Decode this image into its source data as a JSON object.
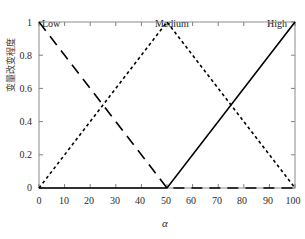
{
  "chart_data": {
    "type": "line",
    "title": "",
    "xlabel": "α",
    "ylabel": "变量改变程度",
    "xlim": [
      0,
      100
    ],
    "ylim": [
      0,
      1
    ],
    "grid": false,
    "legend_position": "none",
    "xticks": [
      "0",
      "10",
      "20",
      "30",
      "40",
      "50",
      "60",
      "70",
      "80",
      "90",
      "100"
    ],
    "xtick_values": [
      0,
      10,
      20,
      30,
      40,
      50,
      60,
      70,
      80,
      90,
      100
    ],
    "yticks": [
      "0",
      "0.2",
      "0.4",
      "0.6",
      "0.8",
      "1"
    ],
    "ytick_values": [
      0,
      0.2,
      0.4,
      0.6,
      0.8,
      1
    ],
    "series": [
      {
        "name": "Low",
        "style": "dashed",
        "color": "#000000",
        "x": [
          0,
          50,
          100
        ],
        "y": [
          1,
          0,
          0
        ]
      },
      {
        "name": "Medium",
        "style": "dotted",
        "color": "#000000",
        "x": [
          0,
          50,
          100
        ],
        "y": [
          0,
          1,
          0
        ]
      },
      {
        "name": "High",
        "style": "solid",
        "color": "#000000",
        "x": [
          0,
          50,
          100
        ],
        "y": [
          0,
          0,
          1
        ]
      }
    ],
    "annotations": [
      {
        "text": "Low",
        "x": 2,
        "y": 1.0
      },
      {
        "text": "Medium",
        "x": 43,
        "y": 1.0
      },
      {
        "text": "High",
        "x": 90,
        "y": 1.0
      }
    ],
    "axis_color": "#808080",
    "line_color": "#000000"
  },
  "axes": {
    "ylabel": "变量改变程度",
    "xlabel": "α"
  },
  "ticks": {
    "y": [
      "1",
      "0.8",
      "0.6",
      "0.4",
      "0.2",
      "0"
    ],
    "x": [
      "0",
      "10",
      "20",
      "30",
      "40",
      "50",
      "60",
      "70",
      "80",
      "90",
      "100"
    ]
  },
  "annotations": {
    "low": "Low",
    "medium": "Medium",
    "high": "High"
  }
}
